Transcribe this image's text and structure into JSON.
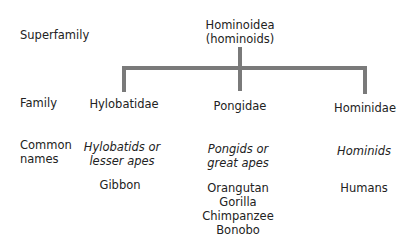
{
  "rows": {
    "superfamily": "Superfamily",
    "family": "Family",
    "common_names_line1": "Common",
    "common_names_line2": "names"
  },
  "superfamily": {
    "name": "Hominoidea",
    "common": "(hominoids)"
  },
  "families": [
    {
      "name": "Hylobatidae",
      "common_line1": "Hylobatids or",
      "common_line2": "lesser apes",
      "members": [
        "Gibbon"
      ]
    },
    {
      "name": "Pongidae",
      "common_line1": "Pongids or",
      "common_line2": "great apes",
      "members": [
        "Orangutan",
        "Gorilla",
        "Chimpanzee",
        "Bonobo"
      ]
    },
    {
      "name": "Hominidae",
      "common_line1": "Hominids",
      "members": [
        "Humans"
      ]
    }
  ],
  "colors": {
    "line": "#7a7a7a",
    "text": "#222222"
  }
}
